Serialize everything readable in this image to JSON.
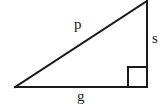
{
  "figure": {
    "name": "right-triangle-with-labeled-sides",
    "background_color": "#ffffff",
    "stroke_color": "#1a1a1a",
    "stroke_width": 2,
    "width": 166,
    "height": 105,
    "vertices": {
      "left": [
        15,
        87
      ],
      "bottom_right": [
        147,
        87
      ],
      "top_right": [
        147,
        1
      ]
    },
    "right_angle_marker": {
      "at_vertex": "bottom_right",
      "size": 20,
      "x": 128,
      "y": 67
    },
    "labels": {
      "hypotenuse": "p",
      "vertical_leg": "s",
      "horizontal_leg": "g"
    }
  }
}
